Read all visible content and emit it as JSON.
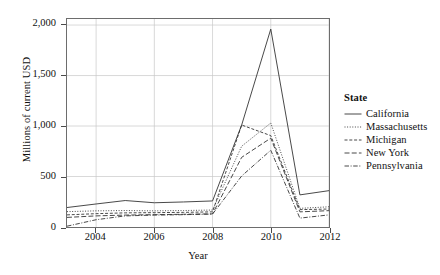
{
  "chart_data": {
    "type": "line",
    "title": "",
    "xlabel": "Year",
    "ylabel": "Millions of current USD",
    "x": [
      2003,
      2004,
      2005,
      2006,
      2007,
      2008,
      2009,
      2010,
      2011,
      2012
    ],
    "xlim": [
      2003,
      2012
    ],
    "ylim": [
      0,
      2060
    ],
    "xticks": [
      2004,
      2006,
      2008,
      2010,
      2012
    ],
    "yticks": [
      0,
      500,
      1000,
      1500,
      2000
    ],
    "ytick_labels": [
      "0",
      "500",
      "1,000",
      "1,500",
      "2,000"
    ],
    "xtick_labels": [
      "2004",
      "2006",
      "2008",
      "2010",
      "2012"
    ],
    "grid": true,
    "grid_color": "#c8c8c8",
    "legend_position": "right",
    "legend_title": "State",
    "series": [
      {
        "name": "California",
        "dash": "solid",
        "values": [
          193,
          228,
          262,
          240,
          248,
          258,
          1010,
          1960,
          318,
          360
        ]
      },
      {
        "name": "Massachusetts",
        "dash": "dotted",
        "values": [
          152,
          160,
          163,
          160,
          163,
          168,
          800,
          1030,
          185,
          200
        ]
      },
      {
        "name": "Michigan",
        "dash": "dashed",
        "values": [
          120,
          132,
          140,
          142,
          145,
          150,
          1010,
          905,
          172,
          178
        ]
      },
      {
        "name": "New York",
        "dash": "longdash",
        "values": [
          95,
          110,
          118,
          122,
          126,
          130,
          690,
          880,
          150,
          162
        ]
      },
      {
        "name": "Pennsylvania",
        "dash": "dashdot",
        "values": [
          8,
          72,
          110,
          118,
          122,
          128,
          505,
          760,
          88,
          120
        ]
      }
    ]
  }
}
